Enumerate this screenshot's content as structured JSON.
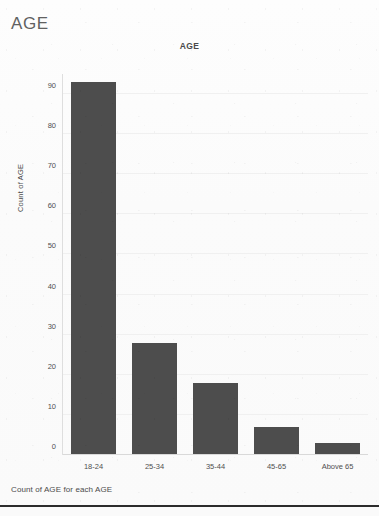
{
  "page": {
    "header_title": "AGE",
    "caption": "Count of AGE for each AGE"
  },
  "chart_data": {
    "type": "bar",
    "title": "AGE",
    "xlabel": "",
    "ylabel": "Count of AGE",
    "categories": [
      "18-24",
      "25-34",
      "35-44",
      "45-65",
      "Above 65"
    ],
    "values": [
      93,
      28,
      18,
      7,
      3
    ],
    "ylim": [
      0,
      95
    ],
    "yticks": [
      0,
      10,
      20,
      30,
      40,
      50,
      60,
      70,
      80,
      90
    ],
    "ytick_labels": [
      "0",
      "10",
      "20",
      "30",
      "40",
      "50",
      "60",
      "70",
      "80",
      "90"
    ],
    "grid": true,
    "legend": null,
    "bar_color": "#4d4d4d",
    "gridline_color": "#f0f0f0",
    "axis_color": "#d9d9d9"
  }
}
